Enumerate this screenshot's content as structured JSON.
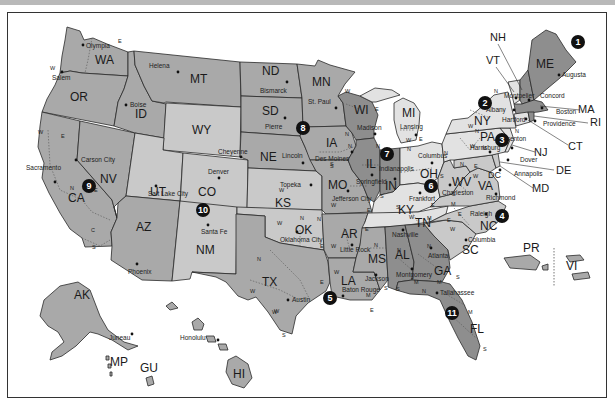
{
  "map": {
    "title": "United States Courts of Appeals and District Courts",
    "colors": {
      "circuit_dark": "#8e8e8e",
      "circuit_mid": "#a9a9a9",
      "circuit_light": "#c9c9c9",
      "circuit_lightest": "#e2e2e2",
      "border": "#2a2a2a",
      "marker": "#111111",
      "frame": "#333333",
      "top_band": "#b9b9b9"
    },
    "circuits": [
      {
        "number": "1",
        "x": 578,
        "y": 42
      },
      {
        "number": "2",
        "x": 485,
        "y": 103
      },
      {
        "number": "3",
        "x": 502,
        "y": 140
      },
      {
        "number": "4",
        "x": 502,
        "y": 213
      },
      {
        "number": "5",
        "x": 330,
        "y": 296
      },
      {
        "number": "6",
        "x": 431,
        "y": 186
      },
      {
        "number": "7",
        "x": 387,
        "y": 154
      },
      {
        "number": "8",
        "x": 303,
        "y": 128
      },
      {
        "number": "9",
        "x": 90,
        "y": 215
      },
      {
        "number": "10",
        "x": 203,
        "y": 210
      },
      {
        "number": "11",
        "x": 452,
        "y": 313
      }
    ],
    "states": [
      {
        "abbr": "WA",
        "x": 95,
        "y": 64
      },
      {
        "abbr": "OR",
        "x": 77,
        "y": 101
      },
      {
        "abbr": "ID",
        "x": 140,
        "y": 118
      },
      {
        "abbr": "MT",
        "x": 197,
        "y": 83
      },
      {
        "abbr": "WY",
        "x": 228,
        "y": 137
      },
      {
        "abbr": "ND",
        "x": 291,
        "y": 75
      },
      {
        "abbr": "SD",
        "x": 289,
        "y": 110
      },
      {
        "abbr": "NE",
        "x": 285,
        "y": 157
      },
      {
        "abbr": "MN",
        "x": 348,
        "y": 81
      },
      {
        "abbr": "IA",
        "x": 355,
        "y": 143
      },
      {
        "abbr": "WI",
        "x": 392,
        "y": 112
      },
      {
        "abbr": "IL",
        "x": 372,
        "y": 165
      },
      {
        "abbr": "MI",
        "x": 419,
        "y": 117
      },
      {
        "abbr": "IN",
        "x": 398,
        "y": 192
      },
      {
        "abbr": "OH",
        "x": 435,
        "y": 178
      },
      {
        "abbr": "NV",
        "x": 106,
        "y": 212
      },
      {
        "abbr": "CA",
        "x": 70,
        "y": 234
      },
      {
        "abbr": "UT",
        "x": 152,
        "y": 217
      },
      {
        "abbr": "CO",
        "x": 208,
        "y": 195
      },
      {
        "abbr": "KS",
        "x": 282,
        "y": 203
      },
      {
        "abbr": "MO",
        "x": 344,
        "y": 189
      },
      {
        "abbr": "KY",
        "x": 409,
        "y": 212
      },
      {
        "abbr": "WV",
        "x": 462,
        "y": 185
      },
      {
        "abbr": "VA",
        "x": 485,
        "y": 191
      },
      {
        "abbr": "AZ",
        "x": 144,
        "y": 262
      },
      {
        "abbr": "NM",
        "x": 208,
        "y": 256
      },
      {
        "abbr": "OK",
        "x": 301,
        "y": 230
      },
      {
        "abbr": "AR",
        "x": 348,
        "y": 238
      },
      {
        "abbr": "TN",
        "x": 420,
        "y": 228
      },
      {
        "abbr": "NC",
        "x": 490,
        "y": 227
      },
      {
        "abbr": "SC",
        "x": 474,
        "y": 251
      },
      {
        "abbr": "MS",
        "x": 373,
        "y": 263
      },
      {
        "abbr": "AL",
        "x": 408,
        "y": 260
      },
      {
        "abbr": "GA",
        "x": 443,
        "y": 285
      },
      {
        "abbr": "LA",
        "x": 350,
        "y": 285
      },
      {
        "abbr": "TX",
        "x": 264,
        "y": 284
      },
      {
        "abbr": "FL",
        "x": 475,
        "y": 333
      },
      {
        "abbr": "AK",
        "x": 82,
        "y": 294
      },
      {
        "abbr": "HI",
        "x": 241,
        "y": 376
      },
      {
        "abbr": "MP",
        "x": 124,
        "y": 365
      },
      {
        "abbr": "GU",
        "x": 148,
        "y": 370
      },
      {
        "abbr": "PR",
        "x": 531,
        "y": 251
      },
      {
        "abbr": "VI",
        "x": 570,
        "y": 265
      },
      {
        "abbr": "ME",
        "x": 565,
        "y": 60
      },
      {
        "abbr": "NY",
        "x": 485,
        "y": 121
      },
      {
        "abbr": "PA",
        "x": 488,
        "y": 137
      }
    ],
    "callouts": [
      {
        "abbr": "NH",
        "x": 490,
        "y": 41
      },
      {
        "abbr": "VT",
        "x": 488,
        "y": 64
      },
      {
        "abbr": "MA",
        "x": 583,
        "y": 112
      },
      {
        "abbr": "RI",
        "x": 591,
        "y": 125
      },
      {
        "abbr": "CT",
        "x": 570,
        "y": 148
      },
      {
        "abbr": "NJ",
        "x": 537,
        "y": 154
      },
      {
        "abbr": "DE",
        "x": 556,
        "y": 172
      },
      {
        "abbr": "MD",
        "x": 535,
        "y": 191
      },
      {
        "abbr": "DC",
        "x": 497,
        "y": 173
      }
    ],
    "capitals": [
      {
        "name": "Olympia",
        "x": 85,
        "y": 49
      },
      {
        "name": "Salem",
        "x": 63,
        "y": 76
      },
      {
        "name": "Helena",
        "x": 177,
        "y": 68
      },
      {
        "name": "Boise",
        "x": 130,
        "y": 106
      },
      {
        "name": "Bismarck",
        "x": 278,
        "y": 91
      },
      {
        "name": "St. Paul",
        "x": 331,
        "y": 102
      },
      {
        "name": "Pierre",
        "x": 278,
        "y": 126
      },
      {
        "name": "Madison",
        "x": 393,
        "y": 128
      },
      {
        "name": "Lansing",
        "x": 411,
        "y": 127
      },
      {
        "name": "Des Moines",
        "x": 352,
        "y": 156
      },
      {
        "name": "Lincoln",
        "x": 285,
        "y": 167
      },
      {
        "name": "Cheyenne",
        "x": 210,
        "y": 154
      },
      {
        "name": "Salt Lake City",
        "x": 148,
        "y": 194
      },
      {
        "name": "Sacramento",
        "x": 29,
        "y": 166
      },
      {
        "name": "Carson City",
        "x": 75,
        "y": 162
      },
      {
        "name": "Denver",
        "x": 207,
        "y": 172
      },
      {
        "name": "Topeka",
        "x": 284,
        "y": 185
      },
      {
        "name": "Jefferson City",
        "x": 337,
        "y": 200
      },
      {
        "name": "Springfield",
        "x": 367,
        "y": 174
      },
      {
        "name": "Indianapolis",
        "x": 386,
        "y": 168
      },
      {
        "name": "Columbus",
        "x": 423,
        "y": 156
      },
      {
        "name": "Frankfort",
        "x": 415,
        "y": 197
      },
      {
        "name": "Charleston",
        "x": 450,
        "y": 190
      },
      {
        "name": "Richmond",
        "x": 490,
        "y": 199
      },
      {
        "name": "Nashville",
        "x": 405,
        "y": 233
      },
      {
        "name": "Raleigh",
        "x": 482,
        "y": 214
      },
      {
        "name": "Columbia",
        "x": 475,
        "y": 239
      },
      {
        "name": "Atlanta",
        "x": 432,
        "y": 257
      },
      {
        "name": "Montgomery",
        "x": 401,
        "y": 279
      },
      {
        "name": "Tallahassee",
        "x": 440,
        "y": 292
      },
      {
        "name": "Jackson",
        "x": 375,
        "y": 280
      },
      {
        "name": "Baton Rouge",
        "x": 339,
        "y": 294
      },
      {
        "name": "Little Rock",
        "x": 348,
        "y": 252
      },
      {
        "name": "Oklahoma City",
        "x": 293,
        "y": 240
      },
      {
        "name": "Austin",
        "x": 293,
        "y": 300
      },
      {
        "name": "Santa Fe",
        "x": 205,
        "y": 233
      },
      {
        "name": "Phoenix",
        "x": 138,
        "y": 275
      },
      {
        "name": "Augusta",
        "x": 562,
        "y": 76
      },
      {
        "name": "Montpelier",
        "x": 525,
        "y": 95
      },
      {
        "name": "Concord",
        "x": 547,
        "y": 98
      },
      {
        "name": "Albany",
        "x": 505,
        "y": 108
      },
      {
        "name": "Boston",
        "x": 560,
        "y": 113
      },
      {
        "name": "Hartford",
        "x": 528,
        "y": 119
      },
      {
        "name": "Providence",
        "x": 545,
        "y": 125
      },
      {
        "name": "Harrisburg",
        "x": 485,
        "y": 148
      },
      {
        "name": "Trenton",
        "x": 530,
        "y": 142
      },
      {
        "name": "Dover",
        "x": 532,
        "y": 163
      },
      {
        "name": "Annapolis",
        "x": 525,
        "y": 174
      },
      {
        "name": "Juneau",
        "x": 116,
        "y": 338
      },
      {
        "name": "Honolulu",
        "x": 200,
        "y": 338
      }
    ],
    "district_marks": [
      {
        "t": "W",
        "x": 50,
        "y": 70
      },
      {
        "t": "E",
        "x": 118,
        "y": 43
      },
      {
        "t": "W",
        "x": 38,
        "y": 134
      },
      {
        "t": "E",
        "x": 61,
        "y": 138
      },
      {
        "t": "C",
        "x": 91,
        "y": 232
      },
      {
        "t": "S",
        "x": 92,
        "y": 249
      },
      {
        "t": "N",
        "x": 70,
        "y": 190
      },
      {
        "t": "W",
        "x": 345,
        "y": 93
      },
      {
        "t": "E",
        "x": 375,
        "y": 111
      },
      {
        "t": "N",
        "x": 345,
        "y": 136
      },
      {
        "t": "S",
        "x": 330,
        "y": 166
      },
      {
        "t": "N",
        "x": 376,
        "y": 148
      },
      {
        "t": "S",
        "x": 380,
        "y": 198
      },
      {
        "t": "W",
        "x": 406,
        "y": 142
      },
      {
        "t": "E",
        "x": 419,
        "y": 141
      },
      {
        "t": "N",
        "x": 407,
        "y": 151
      },
      {
        "t": "S",
        "x": 396,
        "y": 209
      },
      {
        "t": "N",
        "x": 444,
        "y": 155
      },
      {
        "t": "S",
        "x": 440,
        "y": 178
      },
      {
        "t": "W",
        "x": 409,
        "y": 219
      },
      {
        "t": "E",
        "x": 431,
        "y": 207
      },
      {
        "t": "W",
        "x": 331,
        "y": 207
      },
      {
        "t": "E",
        "x": 367,
        "y": 212
      },
      {
        "t": "N",
        "x": 317,
        "y": 221
      },
      {
        "t": "W",
        "x": 277,
        "y": 225
      },
      {
        "t": "E",
        "x": 320,
        "y": 248
      },
      {
        "t": "W",
        "x": 331,
        "y": 248
      },
      {
        "t": "E",
        "x": 365,
        "y": 231
      },
      {
        "t": "N",
        "x": 374,
        "y": 247
      },
      {
        "t": "S",
        "x": 384,
        "y": 290
      },
      {
        "t": "N",
        "x": 257,
        "y": 261
      },
      {
        "t": "E",
        "x": 320,
        "y": 284
      },
      {
        "t": "W",
        "x": 274,
        "y": 313
      },
      {
        "t": "S",
        "x": 282,
        "y": 337
      },
      {
        "t": "W",
        "x": 334,
        "y": 274
      },
      {
        "t": "M",
        "x": 366,
        "y": 297
      },
      {
        "t": "E",
        "x": 370,
        "y": 312
      },
      {
        "t": "N",
        "x": 397,
        "y": 252
      },
      {
        "t": "M",
        "x": 414,
        "y": 284
      },
      {
        "t": "S",
        "x": 396,
        "y": 291
      },
      {
        "t": "N",
        "x": 427,
        "y": 248
      },
      {
        "t": "M",
        "x": 437,
        "y": 284
      },
      {
        "t": "S",
        "x": 456,
        "y": 279
      },
      {
        "t": "N",
        "x": 422,
        "y": 293
      },
      {
        "t": "M",
        "x": 468,
        "y": 314
      },
      {
        "t": "S",
        "x": 483,
        "y": 351
      },
      {
        "t": "M",
        "x": 451,
        "y": 206
      },
      {
        "t": "E",
        "x": 458,
        "y": 216
      },
      {
        "t": "W",
        "x": 450,
        "y": 231
      },
      {
        "t": "M",
        "x": 427,
        "y": 220
      },
      {
        "t": "E",
        "x": 447,
        "y": 222
      },
      {
        "t": "N",
        "x": 460,
        "y": 166
      },
      {
        "t": "S",
        "x": 452,
        "y": 196
      },
      {
        "t": "W",
        "x": 473,
        "y": 178
      },
      {
        "t": "E",
        "x": 474,
        "y": 168
      },
      {
        "t": "W",
        "x": 470,
        "y": 148
      },
      {
        "t": "M",
        "x": 482,
        "y": 150
      },
      {
        "t": "E",
        "x": 499,
        "y": 147
      },
      {
        "t": "N",
        "x": 494,
        "y": 93
      },
      {
        "t": "W",
        "x": 468,
        "y": 128
      },
      {
        "t": "N",
        "x": 515,
        "y": 133
      },
      {
        "t": "W",
        "x": 82,
        "y": 190
      },
      {
        "t": "E",
        "x": 94,
        "y": 192
      },
      {
        "t": "N",
        "x": 475,
        "y": 133
      },
      {
        "t": "N",
        "x": 300,
        "y": 220
      },
      {
        "t": "W",
        "x": 279,
        "y": 192
      },
      {
        "t": "W",
        "x": 250,
        "y": 293
      },
      {
        "t": "N",
        "x": 348,
        "y": 148
      },
      {
        "t": "S",
        "x": 330,
        "y": 168
      },
      {
        "t": "W",
        "x": 272,
        "y": 314
      }
    ]
  }
}
